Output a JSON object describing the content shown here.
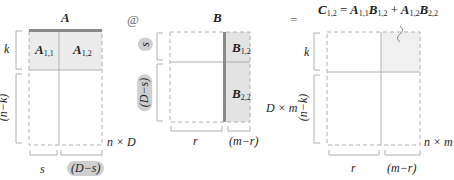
{
  "diagram": {
    "operator_matmul": "@",
    "operator_equals": "=",
    "colors": {
      "shade": "#e6e6e6",
      "highlight_bar": "#8a8a8a",
      "pill": "#cfcfcf",
      "line": "#b0b0b0"
    },
    "matrix_a": {
      "name": "A",
      "dims": "n × D",
      "blocks": [
        {
          "label": "A",
          "sub": "1,1"
        },
        {
          "label": "A",
          "sub": "1,2"
        }
      ],
      "row_labels": [
        "k",
        "(n−k)"
      ],
      "col_labels": [
        "s",
        "(D−s)"
      ]
    },
    "matrix_b": {
      "name": "B",
      "dims": "D × m",
      "blocks": [
        {
          "label": "B",
          "sub": "1,2"
        },
        {
          "label": "B",
          "sub": "2,2"
        }
      ],
      "row_labels": [
        "s",
        "(D−s)"
      ],
      "col_labels": [
        "r",
        "(m−r)"
      ]
    },
    "matrix_c": {
      "dims": "n × m",
      "row_labels": [
        "k",
        "(n−k)"
      ],
      "col_labels": [
        "r",
        "(m−r)"
      ],
      "equation": {
        "lhs": "C",
        "lhs_sub": "1,2",
        "eq": "=",
        "t1a": "A",
        "t1a_sub": "1,1",
        "t1b": "B",
        "t1b_sub": "1,2",
        "plus": "+",
        "t2a": "A",
        "t2a_sub": "1,2",
        "t2b": "B",
        "t2b_sub": "2,2"
      }
    }
  }
}
